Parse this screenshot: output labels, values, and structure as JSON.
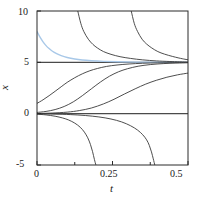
{
  "chart_data": {
    "type": "line",
    "title": "",
    "subtitle": "",
    "xlabel": "t",
    "ylabel": "x",
    "xlim": [
      0,
      0.5
    ],
    "ylim": [
      -5,
      10
    ],
    "xticks": [
      0,
      0.25,
      0.5
    ],
    "xticklabels": [
      "0",
      "0.25",
      "0.5"
    ],
    "yticks": [
      10,
      5,
      0,
      -5
    ],
    "yticklabels": [
      "10",
      "5",
      "0",
      "-5"
    ],
    "grid": false,
    "legend": null,
    "annotations": [],
    "equilibria": [
      {
        "name": "stable-equilibrium",
        "value": 5,
        "color": "#4a4a4a"
      },
      {
        "name": "unstable-equilibrium",
        "value": 0,
        "color": "#4a4a4a"
      }
    ],
    "series": [
      {
        "name": "highlighted-decay-curve",
        "color": "#a8c8e8",
        "note": "starts near x=8 at t=0, decays to x=5",
        "points": [
          [
            0.0,
            8.0
          ],
          [
            0.01,
            7.45
          ],
          [
            0.02,
            7.0
          ],
          [
            0.03,
            6.63
          ],
          [
            0.04,
            6.34
          ],
          [
            0.05,
            6.1
          ],
          [
            0.065,
            5.84
          ],
          [
            0.08,
            5.65
          ],
          [
            0.1,
            5.47
          ],
          [
            0.125,
            5.32
          ],
          [
            0.15,
            5.22
          ],
          [
            0.18,
            5.15
          ],
          [
            0.22,
            5.09
          ],
          [
            0.27,
            5.05
          ],
          [
            0.33,
            5.02
          ],
          [
            0.4,
            5.01
          ],
          [
            0.5,
            5.0
          ]
        ]
      },
      {
        "name": "upper-blowup-curve-1",
        "color": "#3a3a3a",
        "note": "asymptote near t=0.125, descends from +infinity to x=5",
        "points": [
          [
            0.135,
            10.0
          ],
          [
            0.145,
            8.8
          ],
          [
            0.155,
            8.0
          ],
          [
            0.17,
            7.25
          ],
          [
            0.185,
            6.75
          ],
          [
            0.2,
            6.4
          ],
          [
            0.22,
            6.05
          ],
          [
            0.245,
            5.78
          ],
          [
            0.275,
            5.55
          ],
          [
            0.31,
            5.38
          ],
          [
            0.35,
            5.24
          ],
          [
            0.395,
            5.14
          ],
          [
            0.44,
            5.08
          ],
          [
            0.5,
            5.03
          ]
        ]
      },
      {
        "name": "upper-blowup-curve-2",
        "color": "#3a3a3a",
        "note": "asymptote near t=0.305, descends from +infinity to x=5",
        "points": [
          [
            0.312,
            10.0
          ],
          [
            0.322,
            8.8
          ],
          [
            0.333,
            8.0
          ],
          [
            0.348,
            7.25
          ],
          [
            0.363,
            6.78
          ],
          [
            0.38,
            6.4
          ],
          [
            0.4,
            6.05
          ],
          [
            0.422,
            5.8
          ],
          [
            0.448,
            5.58
          ],
          [
            0.47,
            5.42
          ],
          [
            0.49,
            5.3
          ],
          [
            0.5,
            5.25
          ]
        ]
      },
      {
        "name": "sigmoid-curve-1",
        "color": "#3a3a3a",
        "note": "starts near x=1 at t=0, rises toward x=5",
        "points": [
          [
            0.0,
            1.0
          ],
          [
            0.02,
            1.35
          ],
          [
            0.04,
            1.75
          ],
          [
            0.06,
            2.18
          ],
          [
            0.08,
            2.62
          ],
          [
            0.1,
            3.05
          ],
          [
            0.125,
            3.5
          ],
          [
            0.15,
            3.88
          ],
          [
            0.175,
            4.18
          ],
          [
            0.2,
            4.4
          ],
          [
            0.23,
            4.6
          ],
          [
            0.265,
            4.74
          ],
          [
            0.305,
            4.84
          ],
          [
            0.35,
            4.91
          ],
          [
            0.4,
            4.95
          ],
          [
            0.45,
            4.97
          ],
          [
            0.5,
            4.98
          ]
        ]
      },
      {
        "name": "sigmoid-curve-2",
        "color": "#3a3a3a",
        "note": "starts near x=0.1 at t=0, rises toward x=5",
        "points": [
          [
            0.0,
            0.12
          ],
          [
            0.03,
            0.22
          ],
          [
            0.06,
            0.4
          ],
          [
            0.09,
            0.7
          ],
          [
            0.12,
            1.15
          ],
          [
            0.15,
            1.75
          ],
          [
            0.18,
            2.42
          ],
          [
            0.21,
            3.08
          ],
          [
            0.24,
            3.65
          ],
          [
            0.27,
            4.08
          ],
          [
            0.3,
            4.38
          ],
          [
            0.335,
            4.62
          ],
          [
            0.375,
            4.78
          ],
          [
            0.42,
            4.88
          ],
          [
            0.46,
            4.93
          ],
          [
            0.5,
            4.96
          ]
        ]
      },
      {
        "name": "sigmoid-curve-3",
        "color": "#3a3a3a",
        "note": "starts near x=0.02 at t=0, rises slowly toward x=5",
        "points": [
          [
            0.0,
            0.02
          ],
          [
            0.05,
            0.06
          ],
          [
            0.1,
            0.15
          ],
          [
            0.14,
            0.3
          ],
          [
            0.18,
            0.55
          ],
          [
            0.22,
            0.95
          ],
          [
            0.255,
            1.4
          ],
          [
            0.29,
            1.92
          ],
          [
            0.325,
            2.42
          ],
          [
            0.36,
            2.88
          ],
          [
            0.395,
            3.25
          ],
          [
            0.43,
            3.55
          ],
          [
            0.465,
            3.78
          ],
          [
            0.5,
            3.95
          ]
        ]
      },
      {
        "name": "lower-blowup-curve-1",
        "color": "#3a3a3a",
        "note": "starts just below 0, falls to -infinity near t=0.20",
        "points": [
          [
            0.0,
            -0.05
          ],
          [
            0.03,
            -0.12
          ],
          [
            0.06,
            -0.25
          ],
          [
            0.085,
            -0.42
          ],
          [
            0.105,
            -0.62
          ],
          [
            0.125,
            -0.92
          ],
          [
            0.143,
            -1.32
          ],
          [
            0.157,
            -1.8
          ],
          [
            0.168,
            -2.35
          ],
          [
            0.177,
            -3.0
          ],
          [
            0.184,
            -3.7
          ],
          [
            0.19,
            -4.45
          ],
          [
            0.195,
            -5.0
          ]
        ]
      },
      {
        "name": "lower-blowup-curve-2",
        "color": "#3a3a3a",
        "note": "starts just below 0, falls to -infinity near t=0.38",
        "points": [
          [
            0.0,
            -0.01
          ],
          [
            0.06,
            -0.04
          ],
          [
            0.11,
            -0.09
          ],
          [
            0.16,
            -0.18
          ],
          [
            0.205,
            -0.32
          ],
          [
            0.245,
            -0.52
          ],
          [
            0.28,
            -0.8
          ],
          [
            0.31,
            -1.18
          ],
          [
            0.333,
            -1.6
          ],
          [
            0.35,
            -2.05
          ],
          [
            0.363,
            -2.55
          ],
          [
            0.372,
            -3.1
          ],
          [
            0.379,
            -3.72
          ],
          [
            0.385,
            -4.4
          ],
          [
            0.39,
            -5.0
          ]
        ]
      }
    ]
  },
  "axes": {
    "frame_color": "#2a2a2a",
    "xlabel": "t",
    "ylabel": "x",
    "xticklabels": [
      "0",
      "0.25",
      "0.5"
    ],
    "yticklabels": [
      "10",
      "5",
      "0",
      "-5"
    ]
  }
}
